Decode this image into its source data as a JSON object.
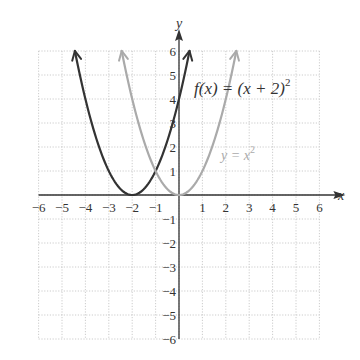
{
  "chart_data": {
    "type": "line",
    "title": "",
    "xlabel": "x",
    "ylabel": "y",
    "xlim": [
      -6,
      6
    ],
    "ylim": [
      -6,
      6
    ],
    "grid": true,
    "grid_style": "dotted",
    "x_ticks": [
      -6,
      -5,
      -4,
      -3,
      -2,
      -1,
      1,
      2,
      3,
      4,
      5,
      6
    ],
    "y_ticks": [
      6,
      5,
      4,
      3,
      2,
      1,
      -1,
      -2,
      -3,
      -4,
      -5,
      -6
    ],
    "x_tick_labels": [
      "−6",
      "−5",
      "−4",
      "−3",
      "−2",
      "−1",
      "1",
      "2",
      "3",
      "4",
      "5",
      "6"
    ],
    "y_tick_labels": [
      "6",
      "5",
      "4",
      "3",
      "2",
      "1",
      "−1",
      "−2",
      "−3",
      "−4",
      "−5",
      "−6"
    ],
    "series": [
      {
        "name": "f(x) = (x + 2)^2",
        "label_main": "f(x) = (x + 2)",
        "label_sup": "2",
        "color": "#333333",
        "expression": "(x+2)^2",
        "x_range": [
          -4.45,
          0.45
        ],
        "vertex": [
          -2,
          0
        ],
        "points": [
          [
            -4.45,
            6
          ],
          [
            -4,
            4
          ],
          [
            -3,
            1
          ],
          [
            -2,
            0
          ],
          [
            -1,
            1
          ],
          [
            0,
            4
          ],
          [
            0.45,
            6
          ]
        ]
      },
      {
        "name": "y = x^2",
        "label_main": "y = x",
        "label_sup": "2",
        "color": "#aaaaaa",
        "expression": "x^2",
        "x_range": [
          -2.45,
          2.45
        ],
        "vertex": [
          0,
          0
        ],
        "points": [
          [
            -2.45,
            6
          ],
          [
            -2,
            4
          ],
          [
            -1,
            1
          ],
          [
            0,
            0
          ],
          [
            1,
            1
          ],
          [
            2,
            4
          ],
          [
            2.45,
            6
          ]
        ]
      }
    ]
  }
}
